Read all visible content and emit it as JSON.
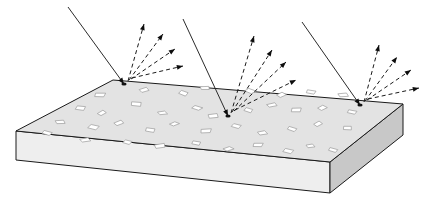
{
  "figure": {
    "name": "light-scattering-rough-slab",
    "labels": [],
    "colors": {
      "background": "#ffffff",
      "slab_top": "#e3e3e3",
      "slab_front": "#eeeeee",
      "slab_side": "#c8c8c8",
      "outline": "#1a1a1a",
      "pit_fill": "#ffffff",
      "pit_stroke": "#9a9a9a",
      "incident_ray": "#2b2b2b",
      "scattered_ray": "#1a1a1a",
      "arrow_head": "#0d0d0d"
    }
  },
  "slab": {
    "name": "slab",
    "top_face": "16,131 113,80 403,104 330,162",
    "front_face": "16,131 16,160 330,193 330,162",
    "side_face": "330,162 330,193 403,135 403,104",
    "depth_px": 30
  },
  "scattering_events": [
    {
      "id": "event-left",
      "hit_point": {
        "x": 124,
        "y": 84
      },
      "incident": {
        "x1": 68,
        "y1": 7,
        "x2": 124,
        "y2": 84
      },
      "scattered": [
        {
          "x1": 128,
          "y1": 81,
          "x2": 144,
          "y2": 24
        },
        {
          "x1": 129,
          "y1": 80,
          "x2": 163,
          "y2": 34
        },
        {
          "x1": 131,
          "y1": 79,
          "x2": 175,
          "y2": 49
        },
        {
          "x1": 132,
          "y1": 78,
          "x2": 183,
          "y2": 66
        }
      ]
    },
    {
      "id": "event-middle",
      "hit_point": {
        "x": 228,
        "y": 116
      },
      "incident": {
        "x1": 183,
        "y1": 19,
        "x2": 228,
        "y2": 116
      },
      "scattered": [
        {
          "x1": 231,
          "y1": 113,
          "x2": 254,
          "y2": 36
        },
        {
          "x1": 232,
          "y1": 112,
          "x2": 272,
          "y2": 50
        },
        {
          "x1": 234,
          "y1": 111,
          "x2": 286,
          "y2": 62
        },
        {
          "x1": 235,
          "y1": 110,
          "x2": 296,
          "y2": 80
        }
      ]
    },
    {
      "id": "event-right",
      "hit_point": {
        "x": 360,
        "y": 105
      },
      "incident": {
        "x1": 302,
        "y1": 22,
        "x2": 360,
        "y2": 105
      },
      "scattered": [
        {
          "x1": 364,
          "y1": 102,
          "x2": 379,
          "y2": 45
        },
        {
          "x1": 365,
          "y1": 101,
          "x2": 397,
          "y2": 57
        },
        {
          "x1": 367,
          "y1": 100,
          "x2": 411,
          "y2": 70
        },
        {
          "x1": 368,
          "y1": 99,
          "x2": 419,
          "y2": 88
        }
      ]
    }
  ],
  "pits": [
    {
      "cx": 100,
      "cy": 95,
      "r": 4.5,
      "rot": 14
    },
    {
      "cx": 144,
      "cy": 90,
      "r": 4.2,
      "rot": -22
    },
    {
      "cx": 183,
      "cy": 93,
      "r": 4.6,
      "rot": 35
    },
    {
      "cx": 205,
      "cy": 88,
      "r": 4.0,
      "rot": -8
    },
    {
      "cx": 250,
      "cy": 91,
      "r": 4.4,
      "rot": 48
    },
    {
      "cx": 281,
      "cy": 95,
      "r": 4.3,
      "rot": -33
    },
    {
      "cx": 311,
      "cy": 92,
      "r": 4.1,
      "rot": 18
    },
    {
      "cx": 343,
      "cy": 95,
      "r": 4.5,
      "rot": -14
    },
    {
      "cx": 80,
      "cy": 108,
      "r": 4.6,
      "rot": 26
    },
    {
      "cx": 102,
      "cy": 113,
      "r": 3.8,
      "rot": -40
    },
    {
      "cx": 136,
      "cy": 104,
      "r": 4.9,
      "rot": 9
    },
    {
      "cx": 162,
      "cy": 113,
      "r": 4.2,
      "rot": -19
    },
    {
      "cx": 197,
      "cy": 108,
      "r": 4.0,
      "rot": 42
    },
    {
      "cx": 213,
      "cy": 116,
      "r": 4.7,
      "rot": -5
    },
    {
      "cx": 248,
      "cy": 110,
      "r": 4.3,
      "rot": 30
    },
    {
      "cx": 272,
      "cy": 105,
      "r": 4.1,
      "rot": -27
    },
    {
      "cx": 296,
      "cy": 110,
      "r": 4.6,
      "rot": 12
    },
    {
      "cx": 322,
      "cy": 108,
      "r": 4.2,
      "rot": -36
    },
    {
      "cx": 352,
      "cy": 112,
      "r": 4.0,
      "rot": 21
    },
    {
      "cx": 60,
      "cy": 122,
      "r": 4.3,
      "rot": -11
    },
    {
      "cx": 93,
      "cy": 127,
      "r": 4.8,
      "rot": 38
    },
    {
      "cx": 119,
      "cy": 123,
      "r": 4.1,
      "rot": -29
    },
    {
      "cx": 150,
      "cy": 130,
      "r": 4.5,
      "rot": 16
    },
    {
      "cx": 174,
      "cy": 124,
      "r": 4.0,
      "rot": -44
    },
    {
      "cx": 206,
      "cy": 131,
      "r": 4.6,
      "rot": 7
    },
    {
      "cx": 236,
      "cy": 126,
      "r": 4.2,
      "rot": 33
    },
    {
      "cx": 262,
      "cy": 133,
      "r": 4.4,
      "rot": -17
    },
    {
      "cx": 292,
      "cy": 129,
      "r": 4.1,
      "rot": 25
    },
    {
      "cx": 318,
      "cy": 124,
      "r": 3.9,
      "rot": -32
    },
    {
      "cx": 347,
      "cy": 128,
      "r": 4.3,
      "rot": 10
    },
    {
      "cx": 47,
      "cy": 133,
      "r": 4.2,
      "rot": 28
    },
    {
      "cx": 85,
      "cy": 140,
      "r": 4.5,
      "rot": -23
    },
    {
      "cx": 127,
      "cy": 142,
      "r": 4.0,
      "rot": 41
    },
    {
      "cx": 160,
      "cy": 146,
      "r": 4.7,
      "rot": -9
    },
    {
      "cx": 196,
      "cy": 143,
      "r": 4.1,
      "rot": 19
    },
    {
      "cx": 228,
      "cy": 149,
      "r": 4.4,
      "rot": -38
    },
    {
      "cx": 258,
      "cy": 145,
      "r": 4.2,
      "rot": 13
    },
    {
      "cx": 288,
      "cy": 151,
      "r": 4.6,
      "rot": 31
    },
    {
      "cx": 310,
      "cy": 146,
      "r": 3.9,
      "rot": -15
    },
    {
      "cx": 333,
      "cy": 150,
      "r": 4.0,
      "rot": 22
    }
  ]
}
